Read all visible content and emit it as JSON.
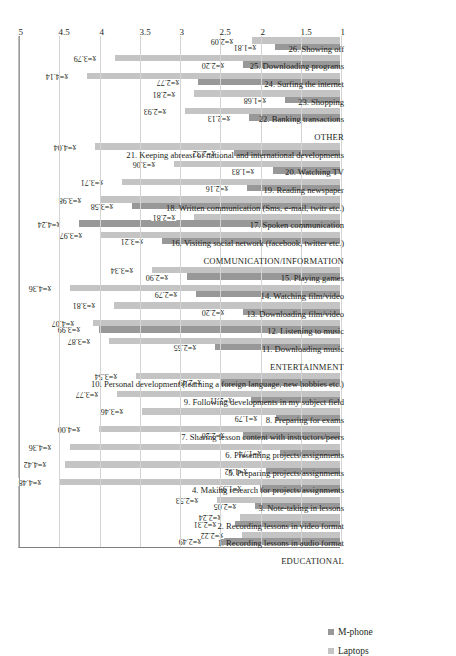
{
  "legend": {
    "position": "bottom-left",
    "items": [
      {
        "label": "M-phone",
        "color": "#989898",
        "key": "mphone"
      },
      {
        "label": "Laptops",
        "color": "#c4c4c4",
        "key": "laptop"
      }
    ]
  },
  "axis": {
    "ticks": [
      "1",
      "1.5",
      "2",
      "2.5",
      "3",
      "3.5",
      "4",
      "4.5",
      "5"
    ],
    "min": 1,
    "max": 5,
    "step": 0.5,
    "grid": true
  },
  "value_label_prefix": "x̄=",
  "chart_data": {
    "type": "bar",
    "orientation": "horizontal",
    "title": "",
    "xlabel": "",
    "ylabel": "",
    "ylim": [
      1,
      5
    ],
    "grid": true,
    "legend_position": "bottom-left",
    "series": [
      {
        "name": "M-phone",
        "color": "#989898",
        "values": [
          2.49,
          2.31,
          2.05,
          1.99,
          1.92,
          1.74,
          2.2,
          1.79,
          2.11,
          2.49,
          2.55,
          3.99,
          2.2,
          2.79,
          2.9,
          3.21,
          4.24,
          3.58,
          2.16,
          1.83,
          2.32,
          2.13,
          1.68,
          2.77,
          2.2,
          1.81
        ]
      },
      {
        "name": "Laptops",
        "color": "#c4c4c4",
        "values": [
          2.22,
          2.24,
          2.53,
          4.48,
          4.42,
          4.36,
          4.0,
          3.46,
          3.77,
          3.54,
          3.87,
          4.07,
          3.81,
          4.36,
          3.34,
          3.97,
          2.81,
          3.98,
          3.71,
          3.06,
          4.04,
          2.93,
          2.81,
          4.14,
          3.79,
          2.09
        ]
      }
    ],
    "section_headers": [
      "EDUCATIONAL",
      "ENTERTAINMENT",
      "COMMUNICATION/INFORMATION",
      "OTHER"
    ],
    "categories": [
      "1.  Recording lessons in audio format",
      "2.  Recording lessons in video format",
      "3. Note-taking in lessons",
      "4. Making research for projects/assignments",
      "5. Preparing projects/assignments",
      "6. Presenting projects/assignments",
      "7. Sharing lesson content with instructors/peers",
      "8. Preparing for exams",
      "9. Following developments in my subject field",
      "10. Personal development (learning a foreign language, new hobbies etc.)",
      "11. Downloading music",
      "12. Listening to music",
      "13. Downloading film/video",
      "14. Watching film/video",
      "15. Playing games",
      "16. Visiting social network (facebook, twitter etc.)",
      "17. Spoken communication",
      "18. Written communication (Sms, e-mail, twitr etc.)",
      "19. Reading newspaper",
      "20.  Watching TV",
      "21. Keeping abreast of national and international developments",
      "22. Banking transactions",
      "23. Shopping",
      "24. Surfing the internet",
      "25. Downloading programs",
      "26. Showing off"
    ],
    "groups": [
      {
        "header": "EDUCATIONAL",
        "items": [
          {
            "label": "1.  Recording lessons in audio format",
            "mphone": 2.49,
            "laptop": 2.22
          },
          {
            "label": "2.  Recording lessons in video format",
            "mphone": 2.31,
            "laptop": 2.24
          },
          {
            "label": "3. Note-taking in lessons",
            "mphone": 2.05,
            "laptop": 2.53
          },
          {
            "label": "4. Making research for projects/assignments",
            "mphone": 1.99,
            "laptop": 4.48
          },
          {
            "label": "5. Preparing projects/assignments",
            "mphone": 1.92,
            "laptop": 4.42
          },
          {
            "label": "6. Presenting projects/assignments",
            "mphone": 1.74,
            "laptop": 4.36
          },
          {
            "label": "7. Sharing lesson content with instructors/peers",
            "mphone": 2.2,
            "laptop": 4.0
          },
          {
            "label": "8. Preparing for exams",
            "mphone": 1.79,
            "laptop": 3.46
          },
          {
            "label": "9. Following developments in my subject field",
            "mphone": 2.11,
            "laptop": 3.77
          },
          {
            "label": "10. Personal development (learning a foreign language, new hobbies etc.)",
            "mphone": 2.49,
            "laptop": 3.54
          }
        ]
      },
      {
        "header": "ENTERTAINMENT",
        "items": [
          {
            "label": "11. Downloading music",
            "mphone": 2.55,
            "laptop": 3.87
          },
          {
            "label": "12. Listening to music",
            "mphone": 3.99,
            "laptop": 4.07
          },
          {
            "label": "13. Downloading film/video",
            "mphone": 2.2,
            "laptop": 3.81
          },
          {
            "label": "14. Watching film/video",
            "mphone": 2.79,
            "laptop": 4.36
          },
          {
            "label": "15. Playing games",
            "mphone": 2.9,
            "laptop": 3.34
          }
        ]
      },
      {
        "header": "COMMUNICATION/INFORMATION",
        "items": [
          {
            "label": "16. Visiting social network (facebook, twitter etc.)",
            "mphone": 3.21,
            "laptop": 3.97
          },
          {
            "label": "17. Spoken communication",
            "mphone": 4.24,
            "laptop": 2.81
          },
          {
            "label": "18. Written communication (Sms, e-mail, twitr etc.)",
            "mphone": 3.58,
            "laptop": 3.98
          },
          {
            "label": "19. Reading newspaper",
            "mphone": 2.16,
            "laptop": 3.71
          },
          {
            "label": "20.  Watching TV",
            "mphone": 1.83,
            "laptop": 3.06
          },
          {
            "label": "21. Keeping abreast of national and international developments",
            "mphone": 2.32,
            "laptop": 4.04
          }
        ]
      },
      {
        "header": "OTHER",
        "items": [
          {
            "label": "22. Banking transactions",
            "mphone": 2.13,
            "laptop": 2.93
          },
          {
            "label": "23. Shopping",
            "mphone": 1.68,
            "laptop": 2.81
          },
          {
            "label": "24. Surfing the internet",
            "mphone": 2.77,
            "laptop": 4.14
          },
          {
            "label": "25. Downloading programs",
            "mphone": 2.2,
            "laptop": 3.79
          },
          {
            "label": "26. Showing off",
            "mphone": 1.81,
            "laptop": 2.09
          }
        ]
      }
    ]
  }
}
